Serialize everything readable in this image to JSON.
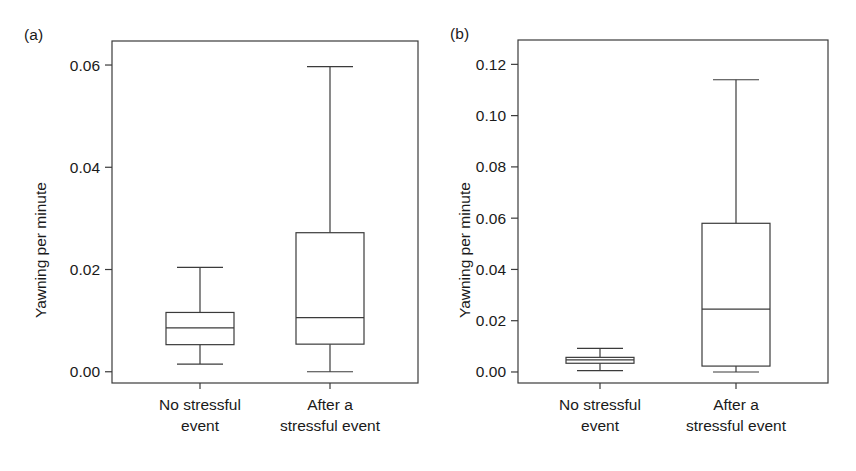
{
  "figure": {
    "background": "#ffffff",
    "line_color": "#3b3b3b",
    "text_color": "#1a1a1a"
  },
  "panels": [
    {
      "tag": "(a)",
      "ylabel": "Yawning per minute"
    },
    {
      "tag": "(b)",
      "ylabel": "Yawning per minute"
    }
  ],
  "chart_data": [
    {
      "type": "box",
      "panel": "(a)",
      "title": "",
      "xlabel": "",
      "ylabel": "Yawning per minute",
      "ylim": [
        -0.0022,
        0.0647
      ],
      "yticks": [
        0.0,
        0.02,
        0.04,
        0.06
      ],
      "ytick_labels": [
        "0.00",
        "0.02",
        "0.04",
        "0.06"
      ],
      "grid": false,
      "legend": "none",
      "categories": [
        "No stressful event",
        "After a stressful event"
      ],
      "category_lines": [
        [
          "No stressful",
          "event"
        ],
        [
          "After a",
          "stressful event"
        ]
      ],
      "boxes": [
        {
          "category": "No stressful event",
          "whisker_low": 0.0015,
          "q1": 0.0053,
          "median": 0.0086,
          "q3": 0.0116,
          "whisker_high": 0.0204
        },
        {
          "category": "After a stressful event",
          "whisker_low": 0.0,
          "q1": 0.0054,
          "median": 0.0106,
          "q3": 0.0272,
          "whisker_high": 0.0597
        }
      ]
    },
    {
      "type": "box",
      "panel": "(b)",
      "title": "",
      "xlabel": "",
      "ylabel": "Yawning per minute",
      "ylim": [
        -0.0043,
        0.1295
      ],
      "yticks": [
        0.0,
        0.02,
        0.04,
        0.06,
        0.08,
        0.1,
        0.12
      ],
      "ytick_labels": [
        "0.00",
        "0.02",
        "0.04",
        "0.06",
        "0.08",
        "0.10",
        "0.12"
      ],
      "grid": false,
      "legend": "none",
      "categories": [
        "No stressful event",
        "After a stressful event"
      ],
      "category_lines": [
        [
          "No stressful",
          "event"
        ],
        [
          "After a",
          "stressful event"
        ]
      ],
      "boxes": [
        {
          "category": "No stressful event",
          "whisker_low": 0.0005,
          "q1": 0.0034,
          "median": 0.0047,
          "q3": 0.0057,
          "whisker_high": 0.0092
        },
        {
          "category": "After a stressful event",
          "whisker_low": 0.0,
          "q1": 0.0023,
          "median": 0.0245,
          "q3": 0.058,
          "whisker_high": 0.114
        }
      ]
    }
  ]
}
